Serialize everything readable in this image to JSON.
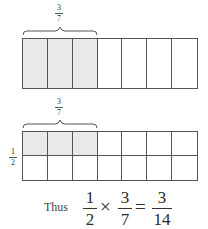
{
  "diagram1": {
    "label": {
      "numerator": "3",
      "denominator": "7"
    },
    "rows": 1,
    "columns": 7,
    "shaded_columns": 3
  },
  "diagram2": {
    "top_label": {
      "numerator": "3",
      "denominator": "7"
    },
    "side_label": {
      "numerator": "1",
      "denominator": "2"
    },
    "rows": 2,
    "columns": 7,
    "shaded_columns": 3,
    "shaded_rows": 1
  },
  "equation": {
    "prefix": "Thus",
    "a": {
      "numerator": "1",
      "denominator": "2"
    },
    "times": "×",
    "b": {
      "numerator": "3",
      "denominator": "7"
    },
    "equals": "=",
    "result": {
      "numerator": "3",
      "denominator": "14"
    }
  },
  "colors": {
    "shade": "#e9e9e9",
    "line": "#555555"
  }
}
